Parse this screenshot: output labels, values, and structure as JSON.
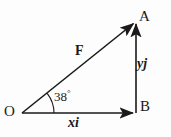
{
  "figure": {
    "type": "vector-component-diagram",
    "stroke_color": "#1a1a1a",
    "background_color": "#fdfdfd",
    "labels": {
      "origin": "O",
      "apex": "A",
      "corner": "B",
      "resultant": "F",
      "vertical_component": "yj",
      "horizontal_component": "xi",
      "angle_value": "38",
      "angle_unit": "°"
    },
    "geometry": {
      "origin_point": [
        22,
        113
      ],
      "corner_point": [
        136,
        113
      ],
      "apex_point": [
        136,
        21
      ],
      "angle_degrees": 38,
      "arc_radius": 32
    }
  }
}
